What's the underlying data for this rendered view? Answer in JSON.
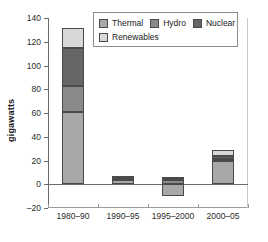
{
  "chart_data": {
    "type": "bar",
    "subtype": "stacked-bar",
    "title": "",
    "xlabel": "",
    "ylabel": "gigawatts",
    "categories": [
      "1980–90",
      "1990–95",
      "1995–2000",
      "2000–05"
    ],
    "series": [
      {
        "name": "Thermal",
        "values": [
          61,
          4,
          -10,
          20
        ]
      },
      {
        "name": "Hydro",
        "values": [
          22,
          1,
          4,
          1
        ]
      },
      {
        "name": "Nuclear",
        "values": [
          32,
          0.5,
          1,
          3
        ]
      },
      {
        "name": "Renewables",
        "values": [
          17,
          1.5,
          1,
          5
        ]
      }
    ],
    "ylim": [
      -20,
      140
    ],
    "yticks": [
      -20,
      0,
      20,
      40,
      60,
      80,
      100,
      120,
      140
    ],
    "ytick_labels": [
      "–20",
      "0",
      "20",
      "40",
      "60",
      "80",
      "100",
      "120",
      "140"
    ],
    "grid": false,
    "legend_position": "top-right",
    "zero_reference_line": true,
    "colors": {
      "Thermal": "#a8a8a8",
      "Hydro": "#8a8a8a",
      "Nuclear": "#666666",
      "Renewables": "#d8d8d8",
      "axis": "#6b6b6b",
      "bar_outline": "#4a4a4a",
      "background": "#ffffff"
    }
  },
  "legend": {
    "row1": [
      {
        "label": "Thermal",
        "color": "#a8a8a8"
      },
      {
        "label": "Hydro",
        "color": "#8a8a8a"
      },
      {
        "label": "Nuclear",
        "color": "#666666"
      }
    ],
    "row2": [
      {
        "label": "Renewables",
        "color": "#d8d8d8"
      }
    ]
  }
}
